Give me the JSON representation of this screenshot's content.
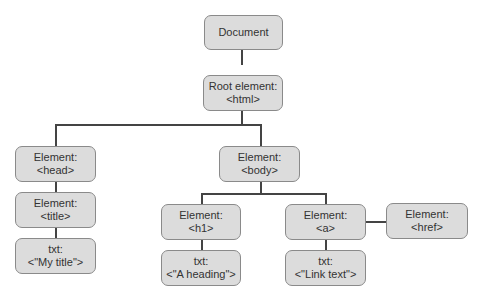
{
  "nodes": {
    "document": {
      "line1": "Document",
      "line2": ""
    },
    "html": {
      "line1": "Root element:",
      "line2": "<html>"
    },
    "head": {
      "line1": "Element:",
      "line2": "<head>"
    },
    "body": {
      "line1": "Element:",
      "line2": "<body>"
    },
    "title": {
      "line1": "Element:",
      "line2": "<title>"
    },
    "title_txt": {
      "line1": "txt:",
      "line2": "<\"My title\">"
    },
    "h1": {
      "line1": "Element:",
      "line2": "<h1>"
    },
    "h1_txt": {
      "line1": "txt:",
      "line2": "<\"A heading\">"
    },
    "a": {
      "line1": "Element:",
      "line2": "<a>"
    },
    "a_txt": {
      "line1": "txt:",
      "line2": "<\"Link text\">"
    },
    "href": {
      "line1": "Element:",
      "line2": "<href>"
    }
  },
  "colors": {
    "node_fill": "#dcdcdc",
    "node_border": "#8a8a8a",
    "connector": "#444444"
  }
}
